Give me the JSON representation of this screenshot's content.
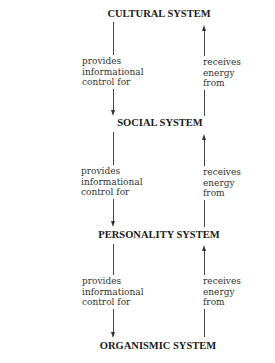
{
  "diagram": {
    "systems": [
      {
        "name": "CULTURAL SYSTEM"
      },
      {
        "name": "SOCIAL SYSTEM"
      },
      {
        "name": "PERSONALITY SYSTEM"
      },
      {
        "name": "ORGANISMIC SYSTEM"
      }
    ],
    "down_label": "provides\ninformational\ncontrol for",
    "up_label": "receives\nenergy\nfrom",
    "links": [
      {
        "from": "CULTURAL SYSTEM",
        "to": "SOCIAL SYSTEM",
        "down": "provides informational control for",
        "up": "receives energy from"
      },
      {
        "from": "SOCIAL SYSTEM",
        "to": "PERSONALITY SYSTEM",
        "down": "provides informational control for",
        "up": "receives energy from"
      },
      {
        "from": "PERSONALITY SYSTEM",
        "to": "ORGANISMIC SYSTEM",
        "down": "provides informational control for",
        "up": "receives energy from"
      }
    ],
    "colors": {
      "text": "#1a1a1a",
      "line": "#444444",
      "background": "#ffffff"
    }
  }
}
